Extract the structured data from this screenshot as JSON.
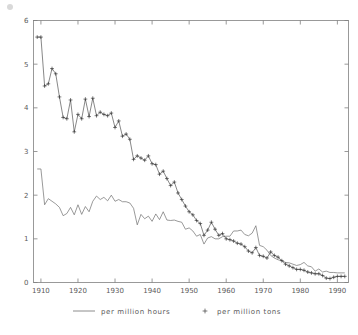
{
  "chart_data": {
    "type": "line",
    "title": "",
    "subtitle": "",
    "xlabel": "",
    "ylabel": "",
    "xlim": [
      1908,
      1993
    ],
    "ylim": [
      0,
      6
    ],
    "grid": false,
    "legend_position": "bottom",
    "xticks": [
      1910,
      1920,
      1930,
      1940,
      1950,
      1960,
      1970,
      1980,
      1990
    ],
    "xticklabels": [
      "1910",
      "1920",
      "1930",
      "1940",
      "1950",
      "1960",
      "1970",
      "1980",
      "1990"
    ],
    "yticks": [
      0,
      1,
      2,
      3,
      4,
      5,
      6
    ],
    "yticklabels": [
      "0",
      "1",
      "2",
      "3",
      "4",
      "5",
      "6"
    ],
    "x": [
      1909,
      1910,
      1911,
      1912,
      1913,
      1914,
      1915,
      1916,
      1917,
      1918,
      1919,
      1920,
      1921,
      1922,
      1923,
      1924,
      1925,
      1926,
      1927,
      1928,
      1929,
      1930,
      1931,
      1932,
      1933,
      1934,
      1935,
      1936,
      1937,
      1938,
      1939,
      1940,
      1941,
      1942,
      1943,
      1944,
      1945,
      1946,
      1947,
      1948,
      1949,
      1950,
      1951,
      1952,
      1953,
      1954,
      1955,
      1956,
      1957,
      1958,
      1959,
      1960,
      1961,
      1962,
      1963,
      1964,
      1965,
      1966,
      1967,
      1968,
      1969,
      1970,
      1971,
      1972,
      1973,
      1974,
      1975,
      1976,
      1977,
      1978,
      1979,
      1980,
      1981,
      1982,
      1983,
      1984,
      1985,
      1986,
      1987,
      1988,
      1989,
      1990,
      1991,
      1992
    ],
    "series": [
      {
        "name": "per million hours",
        "marker": "none",
        "values": [
          2.6,
          2.6,
          1.78,
          1.92,
          1.86,
          1.8,
          1.72,
          1.53,
          1.58,
          1.72,
          1.55,
          1.78,
          1.56,
          1.74,
          1.62,
          1.86,
          1.98,
          1.9,
          1.95,
          1.87,
          2.0,
          1.86,
          1.9,
          1.85,
          1.85,
          1.82,
          1.7,
          1.32,
          1.56,
          1.46,
          1.52,
          1.4,
          1.57,
          1.44,
          1.62,
          1.43,
          1.42,
          1.43,
          1.4,
          1.38,
          1.22,
          1.25,
          1.18,
          1.06,
          1.1,
          0.88,
          1.02,
          1.05,
          1.0,
          1.0,
          1.05,
          1.06,
          1.06,
          1.18,
          1.18,
          1.2,
          1.1,
          1.07,
          1.13,
          1.3,
          0.85,
          0.82,
          0.74,
          0.62,
          0.56,
          0.52,
          0.5,
          0.46,
          0.45,
          0.42,
          0.39,
          0.41,
          0.46,
          0.38,
          0.36,
          0.26,
          0.31,
          0.24,
          0.26,
          0.23,
          0.23,
          0.22,
          0.22,
          0.22
        ]
      },
      {
        "name": "per million tons",
        "marker": "+",
        "values": [
          5.62,
          5.62,
          4.5,
          4.55,
          4.9,
          4.78,
          4.25,
          3.78,
          3.75,
          4.18,
          3.45,
          3.85,
          3.75,
          4.2,
          3.8,
          4.22,
          3.82,
          3.9,
          3.85,
          3.82,
          3.88,
          3.55,
          3.7,
          3.35,
          3.4,
          3.28,
          2.82,
          2.9,
          2.85,
          2.8,
          2.9,
          2.72,
          2.7,
          2.48,
          2.55,
          2.38,
          2.22,
          2.3,
          2.05,
          1.9,
          1.75,
          1.62,
          1.55,
          1.42,
          1.35,
          1.08,
          1.2,
          1.38,
          1.22,
          1.08,
          1.12,
          1.0,
          0.98,
          0.95,
          0.9,
          0.88,
          0.82,
          0.72,
          0.68,
          0.8,
          0.62,
          0.6,
          0.56,
          0.7,
          0.62,
          0.58,
          0.5,
          0.42,
          0.38,
          0.34,
          0.3,
          0.3,
          0.28,
          0.24,
          0.22,
          0.2,
          0.2,
          0.16,
          0.1,
          0.09,
          0.12,
          0.14,
          0.14,
          0.14
        ]
      }
    ]
  },
  "legend": {
    "items": [
      {
        "label": "per million hours",
        "marker": "line"
      },
      {
        "label": "per million tons",
        "marker": "plus"
      }
    ]
  }
}
